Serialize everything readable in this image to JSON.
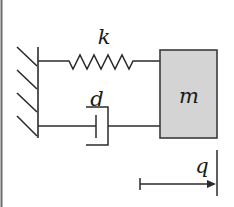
{
  "diagram": {
    "type": "mass-spring-damper",
    "labels": {
      "spring": "k",
      "damper": "d",
      "mass": "m",
      "displacement": "q"
    },
    "colors": {
      "line": "#2b2b2b",
      "mass_fill": "#d4d4d4",
      "mass_border": "#3a3a3a",
      "frame": "#555555",
      "background": "#ffffff"
    },
    "components": [
      {
        "id": "wall",
        "kind": "fixed-support",
        "hatch_count": 4
      },
      {
        "id": "spring",
        "kind": "spring",
        "label": "k",
        "zigzag_peaks": 5
      },
      {
        "id": "damper",
        "kind": "dashpot",
        "label": "d"
      },
      {
        "id": "mass",
        "kind": "block",
        "label": "m"
      },
      {
        "id": "displacement",
        "kind": "arrow",
        "label": "q",
        "direction": "right"
      }
    ]
  }
}
